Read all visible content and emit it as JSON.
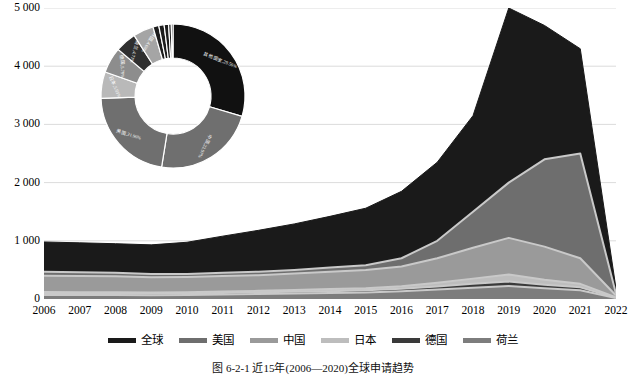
{
  "chart_data": {
    "type": "area",
    "title": "",
    "xlabel": "",
    "ylabel": "",
    "ylim": [
      0,
      5000
    ],
    "yticks": [
      0,
      1000,
      2000,
      3000,
      4000,
      5000
    ],
    "ytick_labels": [
      "0",
      "1 000",
      "2 000",
      "3 000",
      "4 000",
      "5 000"
    ],
    "grid": true,
    "legend_position": "bottom",
    "categories": [
      "2006",
      "2007",
      "2008",
      "2009",
      "2010",
      "2011",
      "2012",
      "2013",
      "2014",
      "2015",
      "2016",
      "2017",
      "2018",
      "2019",
      "2020",
      "2021",
      "2022"
    ],
    "series": [
      {
        "name": "全球",
        "color": "#1a1a1a",
        "values": [
          980,
          965,
          950,
          930,
          975,
          1080,
          1180,
          1290,
          1420,
          1560,
          1850,
          2350,
          3150,
          5000,
          4700,
          4300,
          180
        ]
      },
      {
        "name": "美国",
        "color": "#6e6e6e",
        "values": [
          470,
          460,
          450,
          430,
          430,
          450,
          470,
          500,
          540,
          580,
          700,
          1000,
          1500,
          2000,
          2400,
          2500,
          90
        ]
      },
      {
        "name": "中国",
        "color": "#9a9a9a",
        "values": [
          400,
          395,
          390,
          375,
          380,
          395,
          410,
          440,
          470,
          500,
          560,
          700,
          880,
          1050,
          900,
          700,
          60
        ]
      },
      {
        "name": "日本",
        "color": "#bdbdbd",
        "values": [
          120,
          118,
          115,
          112,
          118,
          130,
          140,
          155,
          170,
          185,
          220,
          280,
          350,
          420,
          330,
          260,
          30
        ]
      },
      {
        "name": "德国",
        "color": "#3a3a3a",
        "values": [
          95,
          93,
          92,
          90,
          95,
          105,
          115,
          125,
          135,
          150,
          175,
          215,
          260,
          300,
          245,
          200,
          22
        ]
      },
      {
        "name": "荷兰",
        "color": "#7d7d7d",
        "values": [
          70,
          69,
          68,
          66,
          70,
          78,
          86,
          95,
          103,
          113,
          132,
          162,
          195,
          225,
          185,
          150,
          16
        ]
      }
    ]
  },
  "donut": {
    "type": "pie",
    "title": "",
    "slices": [
      {
        "label": "其他国家",
        "percent": 29.56,
        "text": "其他国家,29.56%",
        "color": "#111111",
        "text_color": "#ffffff"
      },
      {
        "label": "中国",
        "percent": 22.97,
        "text": "中国,22.97%",
        "color": "#6f6f6f",
        "text_color": "#ffffff"
      },
      {
        "label": "美国",
        "percent": 21.96,
        "text": "美国,21.96%",
        "color": "#6f6f6f",
        "text_color": "#ffffff"
      },
      {
        "label": "日本",
        "percent": 5.93,
        "text": "日本,5.93%",
        "color": "#b9b9b9",
        "text_color": "#ffffff"
      },
      {
        "label": "德国",
        "percent": 5.79,
        "text": "德国,5.79%",
        "color": "#8d8d8d",
        "text_color": "#ffffff"
      },
      {
        "label": "荷兰",
        "percent": 4.71,
        "text": "荷兰,4.71%",
        "color": "#2f2f2f",
        "text_color": "#ffffff"
      },
      {
        "label": "韩国",
        "percent": 4.6,
        "text": "韩国,4.60%",
        "color": "#a5a5a5",
        "text_color": "#ffffff"
      },
      {
        "label": "s1",
        "percent": 1.3,
        "text": "",
        "color": "#1c1c1c",
        "text_color": "#ffffff"
      },
      {
        "label": "s2",
        "percent": 1.2,
        "text": "",
        "color": "#1c1c1c",
        "text_color": "#ffffff"
      },
      {
        "label": "s3",
        "percent": 1.0,
        "text": "",
        "color": "#1c1c1c",
        "text_color": "#ffffff"
      },
      {
        "label": "s4",
        "percent": 0.6,
        "text": "",
        "color": "#1c1c1c",
        "text_color": "#ffffff"
      },
      {
        "label": "s5",
        "percent": 0.38,
        "text": "",
        "color": "#1c1c1c",
        "text_color": "#ffffff"
      }
    ]
  },
  "caption": "图 6-2-1  近15年(2006—2020)全球申请趋势"
}
